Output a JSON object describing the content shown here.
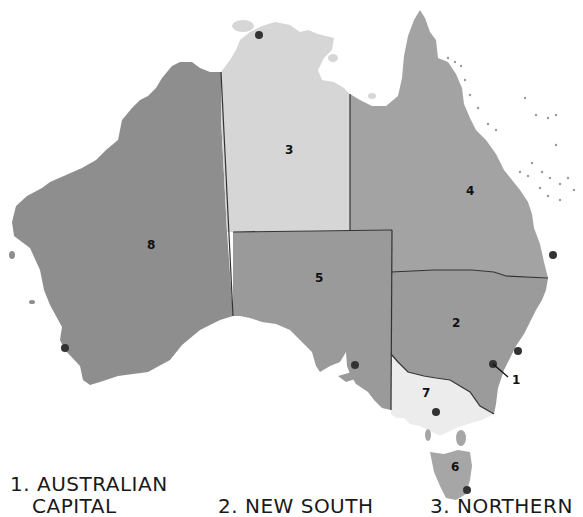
{
  "map": {
    "title": "Australia states and territories",
    "colors": {
      "background": "#ffffff",
      "wa": "#8e8e8e",
      "nt": "#d6d6d6",
      "qld": "#a3a3a3",
      "sa": "#9a9a9a",
      "nsw": "#9b9b9b",
      "vic": "#ececec",
      "tas": "#a6a6a6",
      "act": "#9b9b9b",
      "border": "#333333",
      "capital_dot": "#333333"
    },
    "states": [
      {
        "id": "1",
        "label": "1",
        "name": "Australian Capital Territory"
      },
      {
        "id": "2",
        "label": "2",
        "name": "New South Wales"
      },
      {
        "id": "3",
        "label": "3",
        "name": "Northern Territory"
      },
      {
        "id": "4",
        "label": "4",
        "name": "Queensland"
      },
      {
        "id": "5",
        "label": "5",
        "name": "South Australia"
      },
      {
        "id": "6",
        "label": "6",
        "name": "Tasmania"
      },
      {
        "id": "7",
        "label": "7",
        "name": "Victoria"
      },
      {
        "id": "8",
        "label": "8",
        "name": "Western Australia"
      }
    ]
  },
  "legend": [
    {
      "number": "1.",
      "line1": "AUSTRALIAN",
      "line2": "CAPITAL"
    },
    {
      "number": "2.",
      "line1": "NEW SOUTH",
      "line2": ""
    },
    {
      "number": "3.",
      "line1": "NORTHERN",
      "line2": ""
    }
  ]
}
